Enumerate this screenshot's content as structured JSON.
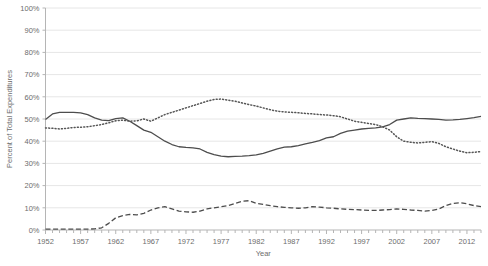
{
  "chart_data": {
    "type": "line",
    "title": "",
    "xlabel": "Year",
    "ylabel": "Percent of Total Expenditures",
    "xlim": [
      1952,
      2014
    ],
    "ylim": [
      0,
      100
    ],
    "grid": true,
    "legend": "none",
    "y_ticks": [
      "0%",
      "10%",
      "20%",
      "30%",
      "40%",
      "50%",
      "60%",
      "70%",
      "80%",
      "90%",
      "100%"
    ],
    "y_tick_values": [
      0,
      10,
      20,
      30,
      40,
      50,
      60,
      70,
      80,
      90,
      100
    ],
    "x_ticks": [
      "1952",
      "1957",
      "1962",
      "1967",
      "1972",
      "1977",
      "1982",
      "1987",
      "1992",
      "1997",
      "2002",
      "2007",
      "2012"
    ],
    "x_tick_values": [
      1952,
      1957,
      1962,
      1967,
      1972,
      1977,
      1982,
      1987,
      1992,
      1997,
      2002,
      2007,
      2012
    ],
    "x": [
      1952,
      1953,
      1954,
      1955,
      1956,
      1957,
      1958,
      1959,
      1960,
      1961,
      1962,
      1963,
      1964,
      1965,
      1966,
      1967,
      1968,
      1969,
      1970,
      1971,
      1972,
      1973,
      1974,
      1975,
      1976,
      1977,
      1978,
      1979,
      1980,
      1981,
      1982,
      1983,
      1984,
      1985,
      1986,
      1987,
      1988,
      1989,
      1990,
      1991,
      1992,
      1993,
      1994,
      1995,
      1996,
      1997,
      1998,
      1999,
      2000,
      2001,
      2002,
      2003,
      2004,
      2005,
      2006,
      2007,
      2008,
      2009,
      2010,
      2011,
      2012,
      2013,
      2014
    ],
    "series": [
      {
        "name": "solid-series",
        "style": "solid",
        "color": "#4d4d4d",
        "values": [
          49.8,
          52.3,
          53.0,
          53.0,
          53.0,
          52.8,
          52.0,
          50.5,
          49.5,
          49.3,
          50.2,
          50.5,
          49.0,
          47.0,
          45.0,
          44.0,
          42.0,
          40.0,
          38.5,
          37.5,
          37.2,
          37.0,
          36.5,
          35.0,
          34.0,
          33.3,
          33.0,
          33.2,
          33.3,
          33.5,
          33.8,
          34.5,
          35.5,
          36.5,
          37.3,
          37.5,
          38.0,
          38.8,
          39.5,
          40.3,
          41.5,
          42.0,
          43.5,
          44.5,
          45.0,
          45.5,
          45.8,
          46.0,
          46.5,
          47.5,
          49.5,
          50.0,
          50.5,
          50.3,
          50.2,
          50.0,
          49.8,
          49.5,
          49.6,
          49.8,
          50.2,
          50.6,
          51.2
        ]
      },
      {
        "name": "dotted-series",
        "style": "dotted",
        "color": "#555555",
        "values": [
          46.0,
          45.8,
          45.5,
          45.8,
          46.2,
          46.3,
          46.5,
          47.0,
          47.5,
          48.3,
          49.2,
          49.5,
          49.0,
          49.2,
          50.0,
          49.0,
          50.5,
          52.0,
          53.0,
          54.0,
          55.0,
          56.0,
          57.0,
          58.0,
          58.8,
          59.0,
          58.5,
          58.0,
          57.2,
          56.5,
          55.8,
          55.0,
          54.2,
          53.5,
          53.2,
          53.0,
          52.8,
          52.5,
          52.3,
          52.0,
          51.8,
          51.5,
          51.0,
          50.0,
          49.0,
          48.5,
          48.0,
          47.5,
          46.5,
          45.0,
          42.0,
          40.0,
          39.5,
          39.2,
          39.5,
          39.8,
          39.0,
          37.5,
          36.5,
          35.5,
          34.8,
          35.0,
          35.3
        ]
      },
      {
        "name": "dashed-series",
        "style": "dashed",
        "color": "#4d4d4d",
        "values": [
          0.4,
          0.4,
          0.4,
          0.4,
          0.4,
          0.4,
          0.4,
          0.5,
          1.0,
          3.0,
          5.5,
          6.5,
          7.0,
          6.8,
          7.5,
          9.0,
          10.0,
          10.5,
          9.5,
          8.5,
          8.2,
          8.0,
          8.5,
          9.5,
          10.0,
          10.5,
          11.0,
          12.0,
          13.0,
          13.2,
          12.0,
          11.5,
          11.0,
          10.5,
          10.2,
          10.0,
          9.8,
          10.0,
          10.5,
          10.3,
          10.0,
          9.8,
          9.5,
          9.3,
          9.2,
          9.0,
          8.8,
          8.8,
          9.0,
          9.2,
          9.5,
          9.3,
          9.0,
          8.8,
          8.5,
          8.8,
          9.5,
          11.0,
          12.0,
          12.3,
          11.8,
          11.0,
          10.5
        ]
      }
    ]
  }
}
